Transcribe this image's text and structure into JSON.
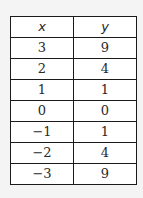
{
  "table": {
    "headers": [
      "x",
      "y"
    ],
    "rows": [
      [
        "3",
        "9"
      ],
      [
        "2",
        "4"
      ],
      [
        "1",
        "1"
      ],
      [
        "0",
        "0"
      ],
      [
        "−1",
        "1"
      ],
      [
        "−2",
        "4"
      ],
      [
        "−3",
        "9"
      ]
    ]
  }
}
